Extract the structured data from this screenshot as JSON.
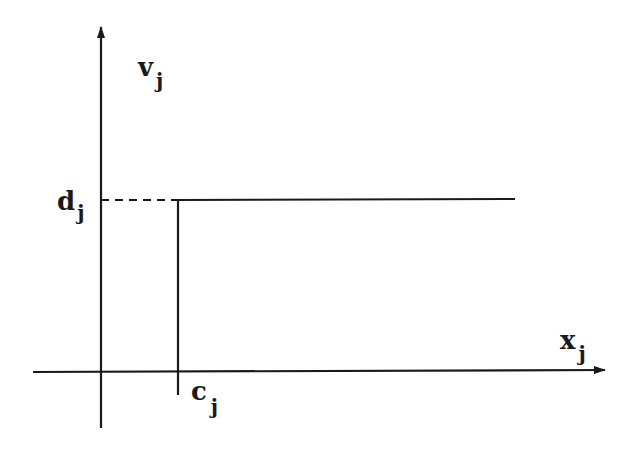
{
  "diagram": {
    "type": "step-function",
    "colors": {
      "line": "#1a1a1a",
      "background": "#ffffff"
    },
    "labels": {
      "y_axis": {
        "base": "v",
        "sub": "j"
      },
      "x_axis": {
        "base": "x",
        "sub": "j"
      },
      "level": {
        "base": "d",
        "sub": "j"
      },
      "threshold": {
        "base": "c",
        "sub": "j"
      }
    }
  }
}
